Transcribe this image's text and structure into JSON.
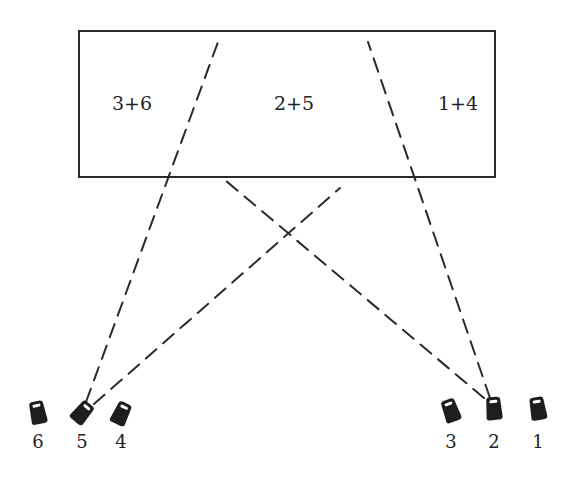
{
  "diagram": {
    "title": "",
    "box": {
      "x": 79,
      "y": 31,
      "width": 416,
      "height": 146
    },
    "regions": [
      {
        "label": "3+6",
        "x": 132,
        "y": 110
      },
      {
        "label": "2+5",
        "x": 294,
        "y": 110
      },
      {
        "label": "1+4",
        "x": 458,
        "y": 110
      }
    ],
    "cameras": [
      {
        "id": "6",
        "label": "6",
        "x": 38,
        "y": 413,
        "rot": -12,
        "label_y": 448
      },
      {
        "id": "5",
        "label": "5",
        "x": 82,
        "y": 413,
        "rot": 40,
        "label_y": 448
      },
      {
        "id": "4",
        "label": "4",
        "x": 121,
        "y": 414,
        "rot": 25,
        "label_y": 448
      },
      {
        "id": "3",
        "label": "3",
        "x": 451,
        "y": 411,
        "rot": -20,
        "label_y": 448
      },
      {
        "id": "2",
        "label": "2",
        "x": 494,
        "y": 409,
        "rot": -5,
        "label_y": 448
      },
      {
        "id": "1",
        "label": "1",
        "x": 538,
        "y": 409,
        "rot": -10,
        "label_y": 448
      }
    ],
    "sight_lines": [
      {
        "from": "5",
        "x1": 86,
        "y1": 402,
        "x2": 218,
        "y2": 42
      },
      {
        "from": "5",
        "x1": 94,
        "y1": 404,
        "x2": 340,
        "y2": 188
      },
      {
        "from": "2",
        "x1": 490,
        "y1": 398,
        "x2": 368,
        "y2": 42
      },
      {
        "from": "2",
        "x1": 484,
        "y1": 398,
        "x2": 225,
        "y2": 180
      }
    ]
  }
}
